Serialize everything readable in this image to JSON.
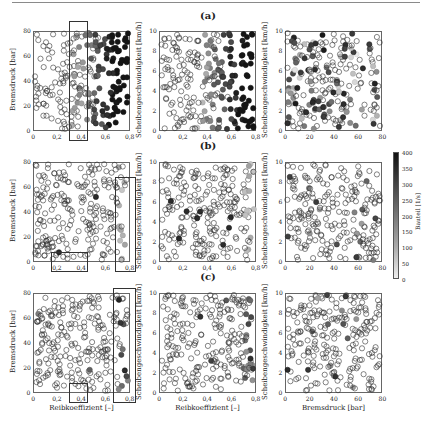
{
  "figure": {
    "rows": [
      {
        "label": "(a)"
      },
      {
        "label": "(b)"
      },
      {
        "label": "(c)"
      }
    ],
    "colorbar": {
      "label": "Bauteil [1/s]",
      "ticks": [
        "400",
        "350",
        "300",
        "250",
        "200",
        "150",
        "100",
        "50",
        "0"
      ]
    }
  },
  "chart_data": [
    {
      "type": "scatter",
      "row": "(a)",
      "col": 1,
      "xlabel": "",
      "ylabel": "Bremsdruck [bar]",
      "xlim": [
        0,
        0.8
      ],
      "ylim": [
        0,
        80
      ],
      "xticks": [
        "0",
        "0,2",
        "0,4",
        "0,6",
        "0,8"
      ],
      "yticks": [
        "0",
        "20",
        "40",
        "60",
        "80"
      ],
      "highlight_boxes": [
        {
          "x0": 0.3,
          "x1": 0.45,
          "y0": -8,
          "y1": 88
        }
      ],
      "color_rule": "shaded by friction coefficient above ~0.3; dark for x>0.6",
      "mode": "gradient_x",
      "grid": false
    },
    {
      "type": "scatter",
      "row": "(a)",
      "col": 2,
      "xlabel": "",
      "ylabel": "Scheibengeschwindigkeit [km/h]",
      "xlim": [
        0,
        0.8
      ],
      "ylim": [
        0,
        10
      ],
      "xticks": [
        "0",
        "0,2",
        "0,4",
        "0,6",
        "0,8"
      ],
      "yticks": [
        "0",
        "2",
        "4",
        "6",
        "8",
        "10"
      ],
      "mode": "gradient_x",
      "grid": false
    },
    {
      "type": "scatter",
      "row": "(a)",
      "col": 3,
      "xlabel": "",
      "ylabel": "Scheibengeschwindigkeit [km/h]",
      "xlim": [
        0,
        80
      ],
      "ylim": [
        0,
        10
      ],
      "xticks": [
        "0",
        "20",
        "40",
        "60",
        "80"
      ],
      "yticks": [
        "0",
        "2",
        "4",
        "6",
        "8",
        "10"
      ],
      "mode": "random_mixed",
      "grid": false
    },
    {
      "type": "scatter",
      "row": "(b)",
      "col": 1,
      "xlabel": "",
      "ylabel": "Bremsdruck [bar]",
      "xlim": [
        0,
        0.8
      ],
      "ylim": [
        0,
        80
      ],
      "xticks": [
        "0",
        "0,2",
        "0,4",
        "0,6",
        "0,8"
      ],
      "yticks": [
        "0",
        "20",
        "40",
        "60",
        "80"
      ],
      "highlight_boxes": [
        {
          "x0": 0.15,
          "x1": 0.45,
          "y0": -8,
          "y1": 8
        },
        {
          "x0": 0.68,
          "x1": 0.85,
          "y0": -8,
          "y1": 68
        }
      ],
      "mode": "mostly_open_light_right",
      "grid": false
    },
    {
      "type": "scatter",
      "row": "(b)",
      "col": 2,
      "xlabel": "",
      "ylabel": "Scheibengeschwindigkeit [km/h]",
      "xlim": [
        0,
        0.8
      ],
      "ylim": [
        0,
        10
      ],
      "xticks": [
        "0",
        "0,2",
        "0,4",
        "0,6",
        "0,8"
      ],
      "yticks": [
        "0",
        "2",
        "4",
        "6",
        "8",
        "10"
      ],
      "mode": "mostly_open_light_right",
      "grid": false
    },
    {
      "type": "scatter",
      "row": "(b)",
      "col": 3,
      "xlabel": "",
      "ylabel": "Scheibengeschwindigkeit [km/h]",
      "xlim": [
        0,
        80
      ],
      "ylim": [
        0,
        10
      ],
      "xticks": [
        "0",
        "20",
        "40",
        "60",
        "80"
      ],
      "yticks": [
        "0",
        "2",
        "4",
        "6",
        "8",
        "10"
      ],
      "mode": "mostly_open",
      "grid": false
    },
    {
      "type": "scatter",
      "row": "(c)",
      "col": 1,
      "xlabel": "Reibkoeffizient [–]",
      "ylabel": "Bremsdruck [bar]",
      "xlim": [
        0,
        0.8
      ],
      "ylim": [
        0,
        80
      ],
      "xticks": [
        "0",
        "0,2",
        "0,4",
        "0,6",
        "0,8"
      ],
      "yticks": [
        "0",
        "20",
        "40",
        "60",
        "80"
      ],
      "highlight_boxes": [
        {
          "x0": 0.3,
          "x1": 0.45,
          "y0": -8,
          "y1": 8
        },
        {
          "x0": 0.66,
          "x1": 0.85,
          "y0": -8,
          "y1": 84
        }
      ],
      "mode": "mostly_open_dark_right",
      "grid": false
    },
    {
      "type": "scatter",
      "row": "(c)",
      "col": 2,
      "xlabel": "Reibkoeffizient [–]",
      "ylabel": "Scheibengeschwindigkeit [km/h]",
      "xlim": [
        0,
        0.8
      ],
      "ylim": [
        0,
        10
      ],
      "xticks": [
        "0",
        "0,2",
        "0,4",
        "0,6",
        "0,8"
      ],
      "yticks": [
        "0",
        "2",
        "4",
        "6",
        "8",
        "10"
      ],
      "mode": "mostly_open_dark_right",
      "grid": false
    },
    {
      "type": "scatter",
      "row": "(c)",
      "col": 3,
      "xlabel": "Bremsdruck [bar]",
      "ylabel": "Scheibengeschwindigkeit [km/h]",
      "xlim": [
        0,
        80
      ],
      "ylim": [
        0,
        10
      ],
      "xticks": [
        "0",
        "20",
        "40",
        "60",
        "80"
      ],
      "yticks": [
        "0",
        "2",
        "4",
        "6",
        "8",
        "10"
      ],
      "mode": "mostly_open",
      "grid": false
    }
  ]
}
